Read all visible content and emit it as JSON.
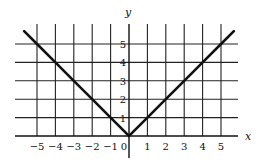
{
  "chart_data": {
    "type": "line",
    "title": "",
    "function": "y = |x|",
    "xlabel": "x",
    "ylabel": "y",
    "xlim": [
      -6,
      6
    ],
    "ylim": [
      0,
      6
    ],
    "grid": true,
    "x_ticks": [
      -5,
      -4,
      -3,
      -2,
      -1,
      0,
      1,
      2,
      3,
      4,
      5
    ],
    "x_tick_labels": [
      "−5",
      "−4",
      "−3",
      "−2",
      "−1",
      "0",
      "1",
      "2",
      "3",
      "4",
      "5"
    ],
    "y_ticks": [
      1,
      2,
      3,
      4,
      5
    ],
    "y_tick_labels": [
      "1",
      "2",
      "3",
      "4",
      "5"
    ],
    "series": [
      {
        "name": "|x|",
        "x": [
          -5.7,
          -5,
          -4,
          -3,
          -2,
          -1,
          0,
          1,
          2,
          3,
          4,
          5,
          5.7
        ],
        "y": [
          5.7,
          5,
          4,
          3,
          2,
          1,
          0,
          1,
          2,
          3,
          4,
          5,
          5.7
        ]
      }
    ]
  }
}
